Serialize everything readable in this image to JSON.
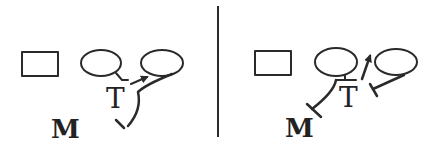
{
  "diagram": {
    "colors": {
      "stroke": "#2a2a2a",
      "background": "#ffffff"
    },
    "left_panel": {
      "labels": {
        "t": "T",
        "m": "M"
      },
      "shapes": [
        "rectangle",
        "ellipse",
        "ellipse"
      ],
      "edges": [
        {
          "from": "ellipse-1",
          "to": "T",
          "type": "line"
        },
        {
          "from": "T",
          "to": "ellipse-2",
          "type": "arrow"
        },
        {
          "from": "ellipse-2",
          "to": "M",
          "type": "inhibition",
          "curved": true
        }
      ]
    },
    "divider": "vertical-line",
    "right_panel": {
      "labels": {
        "t": "T",
        "m": "M"
      },
      "shapes": [
        "rectangle",
        "ellipse",
        "ellipse"
      ],
      "edges": [
        {
          "from": "ellipse-1",
          "to": "T",
          "type": "line"
        },
        {
          "from": "T",
          "to": "ellipse-2",
          "type": "arrow"
        },
        {
          "from": "ellipse-2",
          "to": "T",
          "type": "inhibition"
        },
        {
          "from": "T",
          "to": "M",
          "type": "inhibition"
        }
      ]
    }
  }
}
